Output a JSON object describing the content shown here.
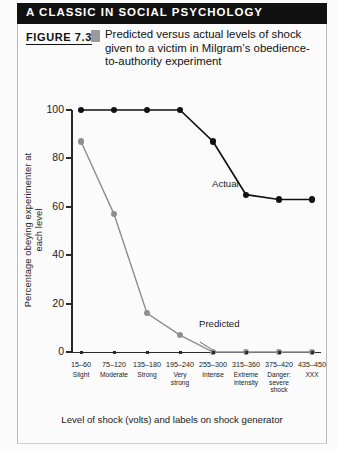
{
  "banner": {
    "title": "A CLASSIC IN SOCIAL PSYCHOLOGY"
  },
  "figure": {
    "number_label": "FIGURE 7.3",
    "caption_lines": [
      "Predicted versus actual levels of shock",
      "given to a victim in Milgram’s obedience-",
      "to-authority experiment"
    ]
  },
  "chart_data": {
    "type": "line",
    "xlabel": "Level of shock (volts) and labels on shock generator",
    "ylabel": "Percentage obeying experimenter at each level",
    "ylim": [
      0,
      100
    ],
    "yticks": [
      0,
      20,
      40,
      60,
      80,
      100
    ],
    "ytick_labels": [
      "0",
      "20",
      "40",
      "60",
      "80",
      "100"
    ],
    "grid": false,
    "legend_position": "inline-annotations",
    "categories": [
      "15–60",
      "75–120",
      "135–180",
      "195–240",
      "255–300",
      "315–360",
      "375–420",
      "435–450"
    ],
    "category_words": [
      [
        "Slight"
      ],
      [
        "Moderate"
      ],
      [
        "Strong"
      ],
      [
        "Very",
        "strong"
      ],
      [
        "Intense"
      ],
      [
        "Extreme",
        "intensity"
      ],
      [
        "Danger:",
        "severe",
        "shock"
      ],
      [
        "XXX"
      ]
    ],
    "series": [
      {
        "name": "Actual",
        "color": "#111111",
        "marker": "circle",
        "values": [
          100,
          100,
          100,
          100,
          87,
          65,
          63,
          63
        ]
      },
      {
        "name": "Predicted",
        "color": "#8e8e8e",
        "marker": "circle",
        "values": [
          87,
          57,
          16,
          7,
          0,
          0,
          0,
          0
        ]
      }
    ],
    "annotations": [
      {
        "text": "Actual",
        "series": "Actual"
      },
      {
        "text": "Predicted",
        "series": "Predicted"
      }
    ]
  },
  "colors": {
    "banner_background": "#111111",
    "banner_text": "#ffffff",
    "actual_series": "#111111",
    "predicted_series": "#8e8e8e",
    "axis": "#2a2a2a",
    "frame_rule": "#b9b9b9"
  }
}
